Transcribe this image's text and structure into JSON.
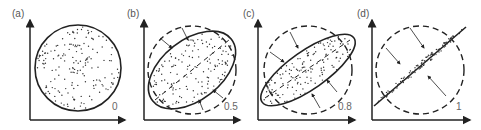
{
  "panels": [
    {
      "label": "(a)",
      "value": "0"
    },
    {
      "label": "(b)",
      "value": "0.5"
    },
    {
      "label": "(c)",
      "value": "0.8"
    },
    {
      "label": "(d)",
      "value": "1"
    }
  ],
  "colors": {
    "stroke": "#222222",
    "dots": "#333333",
    "text": "#555555"
  }
}
